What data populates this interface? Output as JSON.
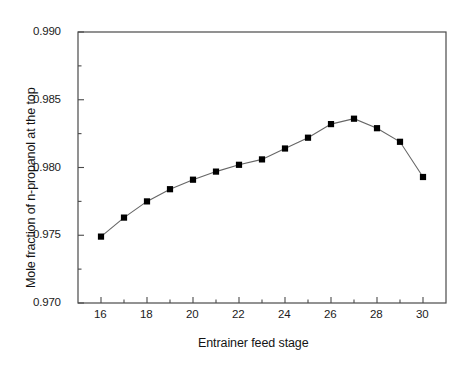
{
  "chart_data": {
    "type": "line",
    "title": "",
    "subtitle": "",
    "xlabel": "Entrainer feed stage",
    "ylabel": "Mole fraction of n-propanol at the top",
    "x": [
      16,
      17,
      18,
      19,
      20,
      21,
      22,
      23,
      24,
      25,
      26,
      27,
      28,
      29,
      30
    ],
    "values": [
      0.9749,
      0.9763,
      0.9775,
      0.9784,
      0.9791,
      0.9797,
      0.9802,
      0.9806,
      0.9814,
      0.9822,
      0.9832,
      0.9836,
      0.9829,
      0.9819,
      0.9793
    ],
    "series": [
      {
        "name": "Mole fraction of n-propanol at the top",
        "values": [
          0.9749,
          0.9763,
          0.9775,
          0.9784,
          0.9791,
          0.9797,
          0.9802,
          0.9806,
          0.9814,
          0.9822,
          0.9832,
          0.9836,
          0.9829,
          0.9819,
          0.9793
        ]
      }
    ],
    "xlim": [
      15,
      31
    ],
    "ylim": [
      0.97,
      0.99
    ],
    "xticks": [
      16,
      18,
      20,
      22,
      24,
      26,
      28,
      30
    ],
    "xtick_labels": [
      "16",
      "18",
      "20",
      "22",
      "24",
      "26",
      "28",
      "30"
    ],
    "xminorticks": [
      17,
      19,
      21,
      23,
      25,
      27,
      29
    ],
    "yticks": [
      0.97,
      0.975,
      0.98,
      0.985,
      0.99
    ],
    "ytick_labels": [
      "0.970",
      "0.975",
      "0.980",
      "0.985",
      "0.990"
    ],
    "yminorticks": [
      0.9725,
      0.9775,
      0.9825,
      0.9875
    ],
    "grid": false,
    "legend": false,
    "legend_position": "none",
    "marker": "square",
    "marker_color": "#000000",
    "line_color": "#555555",
    "axis_color": "#444444",
    "background_color": "#ffffff"
  },
  "axes": {
    "x_title": "Entrainer feed stage",
    "y_title": "Mole fraction of n-propanol at the top"
  }
}
